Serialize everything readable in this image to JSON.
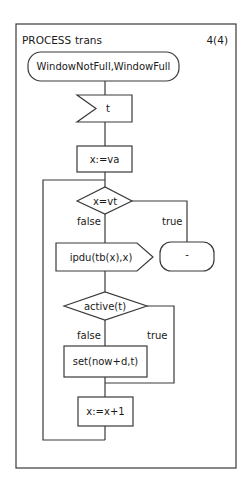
{
  "diagram": {
    "header": {
      "keyword": "PROCESS",
      "name": "trans",
      "page": "4(4)"
    },
    "nodes": {
      "start_state": {
        "type": "state",
        "label": "WindowNotFull,WindowFull"
      },
      "input_t": {
        "type": "input-signal",
        "label": "t"
      },
      "task_init": {
        "type": "task",
        "label": "x:=va"
      },
      "decision_x": {
        "type": "decision",
        "label": "x=vt"
      },
      "output_ipdu": {
        "type": "output-signal",
        "label": "ipdu(tb(x),x)"
      },
      "stop_state": {
        "type": "state",
        "label": "-"
      },
      "decision_active": {
        "type": "decision",
        "label": "active(t)"
      },
      "task_set": {
        "type": "task",
        "label": "set(now+d,t)"
      },
      "task_inc": {
        "type": "task",
        "label": "x:=x+1"
      }
    },
    "edges": {
      "x_false": "false",
      "x_true": "true",
      "active_false": "false",
      "active_true": "true"
    },
    "colors": {
      "line": "#3a3a3a",
      "background": "#ffffff",
      "text": "#1a1a1a"
    }
  }
}
